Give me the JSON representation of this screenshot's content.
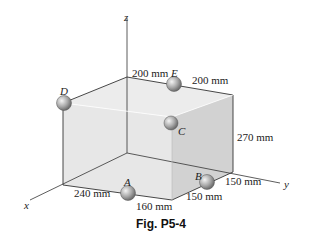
{
  "figure": {
    "caption": "Fig. P5-4",
    "axes": {
      "x": "x",
      "y": "y",
      "z": "z"
    },
    "points": {
      "A": "A",
      "B": "B",
      "C": "C",
      "D": "D",
      "E": "E"
    },
    "dimensions": {
      "top_back_left": "200 mm",
      "top_back_right": "200 mm",
      "height": "270 mm",
      "bottom_x": "240 mm",
      "bottom_front_left": "160 mm",
      "bottom_front_right": "150 mm",
      "bottom_right_y": "150 mm"
    },
    "colors": {
      "box_face": "#e6e6e6",
      "box_side": "#d6d6d6",
      "edge": "#333333",
      "sphere": "#a8a8a8"
    }
  }
}
